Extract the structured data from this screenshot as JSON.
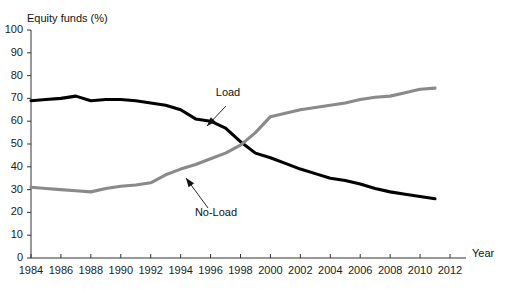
{
  "chart_data": {
    "type": "line",
    "title": "",
    "subtitle": "",
    "xlabel": "Year",
    "ylabel": "Equity funds (%)",
    "xlim": [
      1984,
      2012
    ],
    "ylim": [
      0,
      100
    ],
    "grid": false,
    "legend_position": "inline-annotations",
    "x_ticks": [
      1984,
      1986,
      1988,
      1990,
      1992,
      1994,
      1996,
      1998,
      2000,
      2002,
      2004,
      2006,
      2008,
      2010,
      2012
    ],
    "x_tick_labels": [
      "1984",
      "1986",
      "1988",
      "1990",
      "1992",
      "1994",
      "1996",
      "1998",
      "2000",
      "2002",
      "2004",
      "2006",
      "2008",
      "2010",
      "2012"
    ],
    "y_ticks": [
      0,
      10,
      20,
      30,
      40,
      50,
      60,
      70,
      80,
      90,
      100
    ],
    "y_tick_labels": [
      "0",
      "10",
      "20",
      "30",
      "40",
      "50",
      "60",
      "70",
      "80",
      "90",
      "100"
    ],
    "x": [
      1984,
      1985,
      1986,
      1987,
      1988,
      1989,
      1990,
      1991,
      1992,
      1993,
      1994,
      1995,
      1996,
      1997,
      1998,
      1999,
      2000,
      2001,
      2002,
      2003,
      2004,
      2005,
      2006,
      2007,
      2008,
      2009,
      2010,
      2011
    ],
    "series": [
      {
        "name": "Load",
        "color": "#000000",
        "linewidth": 3.1,
        "values": [
          69,
          69.5,
          70,
          71,
          69,
          69.5,
          69.5,
          69,
          68,
          67,
          65,
          61,
          60,
          57,
          51,
          46,
          44,
          41.5,
          39,
          37,
          35,
          34,
          32.5,
          30.5,
          29,
          28,
          27,
          26
        ]
      },
      {
        "name": "No-Load",
        "color": "#8a8a8a",
        "linewidth": 3.1,
        "values": [
          31,
          30.5,
          30,
          29.5,
          29,
          30.5,
          31.5,
          32,
          33,
          36.5,
          39,
          41,
          43.5,
          46,
          49.5,
          55,
          62,
          63.5,
          65,
          66,
          67,
          68,
          69.5,
          70.5,
          71,
          72.5,
          74,
          74.5
        ]
      }
    ],
    "annotations": [
      {
        "text": "Load",
        "series": "Load",
        "label_x": 228,
        "label_y": 92,
        "arrow_from_x": 226,
        "arrow_from_y": 106,
        "arrow_to_x": 207,
        "arrow_to_y": 126
      },
      {
        "text": "No-Load",
        "series": "No-Load",
        "label_x": 216,
        "label_y": 212,
        "arrow_from_x": 208,
        "arrow_from_y": 208,
        "arrow_to_x": 186,
        "arrow_to_y": 178
      }
    ]
  },
  "axes": {
    "y_axis_title": "Equity funds (%)",
    "x_axis_title": "Year"
  }
}
